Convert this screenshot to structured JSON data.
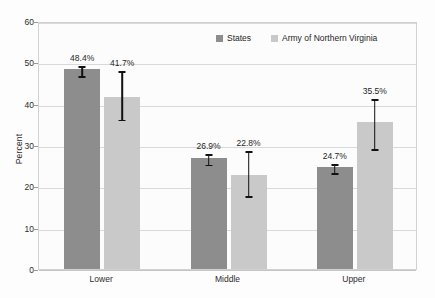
{
  "chart_data": {
    "type": "bar",
    "title": "",
    "subtitle": "",
    "xlabel": "",
    "ylabel": "Percent",
    "ylim": [
      0,
      60
    ],
    "yticks": [
      0,
      10,
      20,
      30,
      40,
      50,
      60
    ],
    "ytick_labels": [
      "0",
      "10",
      "20",
      "30",
      "40",
      "50",
      "60"
    ],
    "grid": true,
    "legend_position": "top-center-inside",
    "categories": [
      "Lower",
      "Middle",
      "Upper"
    ],
    "series": [
      {
        "name": "States",
        "color": "#8d8d8d",
        "values": [
          48.4,
          26.9,
          24.7
        ],
        "value_labels": [
          "48.4%",
          "41.7%",
          "26.9%"
        ],
        "errors_low": [
          47.2,
          25.7,
          23.7
        ],
        "errors_high": [
          49.6,
          28.2,
          25.8
        ]
      },
      {
        "name": "Army of Northern Virginia",
        "color": "#c9c9c9",
        "values": [
          41.7,
          22.8,
          35.5
        ],
        "errors_low": [
          36.6,
          18.1,
          29.5
        ],
        "errors_high": [
          48.3,
          29.0,
          41.5
        ]
      }
    ],
    "bar_labels": {
      "Lower": [
        "48.4%",
        "41.7%"
      ],
      "Middle": [
        "26.9%",
        "22.8%"
      ],
      "Upper": [
        "24.7%",
        "35.5%"
      ]
    }
  },
  "legend": {
    "entries": [
      {
        "label": "States",
        "swatch": "dark-gray"
      },
      {
        "label": "Army of Northern Virginia",
        "swatch": "light-gray"
      }
    ]
  },
  "axes": {
    "y_title": "Percent"
  }
}
